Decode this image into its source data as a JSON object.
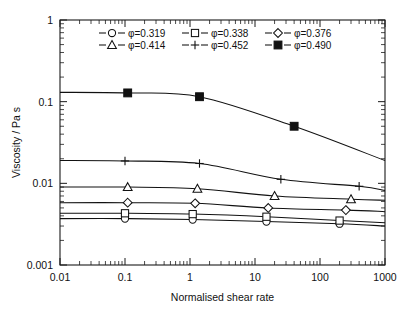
{
  "chart_data": {
    "type": "line",
    "title": "",
    "xlabel": "Normalised shear rate",
    "ylabel": "Viscosity / Pa s",
    "xscale": "log",
    "yscale": "log",
    "xlim": [
      0.01,
      1000
    ],
    "ylim": [
      0.001,
      1
    ],
    "xticks": [
      0.01,
      0.1,
      1,
      10,
      100,
      1000
    ],
    "xticklabels": [
      "0.01",
      "0.1",
      "1",
      "10",
      "100",
      "1000"
    ],
    "yticks": [
      0.001,
      0.01,
      0.1,
      1
    ],
    "yticklabels": [
      "0.001",
      "0.01",
      "0.1",
      "1"
    ],
    "grid": false,
    "legend_position": "upper-center",
    "legend_columns": 3,
    "series": [
      {
        "name": "φ=0.319",
        "phi": 0.319,
        "marker": "circle-open",
        "x": [
          0.01,
          0.1,
          1.1,
          15,
          200,
          1000
        ],
        "y": [
          0.0037,
          0.0037,
          0.0036,
          0.0034,
          0.0032,
          0.003
        ]
      },
      {
        "name": "φ=0.338",
        "phi": 0.338,
        "marker": "square-open",
        "x": [
          0.01,
          0.1,
          1.1,
          15,
          200,
          1000
        ],
        "y": [
          0.0043,
          0.0043,
          0.0042,
          0.0039,
          0.0035,
          0.0033
        ]
      },
      {
        "name": "φ=0.376",
        "phi": 0.376,
        "marker": "diamond-open",
        "x": [
          0.01,
          0.11,
          1.2,
          16,
          250,
          1000
        ],
        "y": [
          0.0058,
          0.0058,
          0.0057,
          0.005,
          0.0047,
          0.0045
        ]
      },
      {
        "name": "φ=0.414",
        "phi": 0.414,
        "marker": "triangle-open",
        "x": [
          0.01,
          0.11,
          1.3,
          20,
          300,
          1000
        ],
        "y": [
          0.009,
          0.009,
          0.0086,
          0.007,
          0.0064,
          0.0062
        ]
      },
      {
        "name": "φ=0.452",
        "phi": 0.452,
        "marker": "plus",
        "x": [
          0.01,
          0.1,
          1.4,
          25,
          400,
          1000
        ],
        "y": [
          0.019,
          0.0188,
          0.0175,
          0.0112,
          0.0092,
          0.0082
        ]
      },
      {
        "name": "φ=0.490",
        "phi": 0.49,
        "marker": "square-filled",
        "x": [
          0.01,
          0.11,
          1.4,
          40,
          1000
        ],
        "y": [
          0.13,
          0.128,
          0.115,
          0.05,
          0.019
        ]
      }
    ]
  },
  "legend": {
    "entries": [
      {
        "label": "φ=0.319"
      },
      {
        "label": "φ=0.338"
      },
      {
        "label": "φ=0.376"
      },
      {
        "label": "φ=0.414"
      },
      {
        "label": "φ=0.452"
      },
      {
        "label": "φ=0.490"
      }
    ]
  },
  "axes": {
    "x_title": "Normalised shear rate",
    "y_title": "Viscosity / Pa s",
    "x_tick_labels": [
      "0.01",
      "0.1",
      "1",
      "10",
      "100",
      "1000"
    ],
    "y_tick_labels": [
      "1",
      "0.1",
      "0.01",
      "0.001"
    ]
  },
  "colors": {
    "line": "#111111",
    "axis": "#1a1a1a",
    "background": "#ffffff",
    "marker_fill_open": "#ffffff",
    "marker_fill_solid": "#111111"
  }
}
